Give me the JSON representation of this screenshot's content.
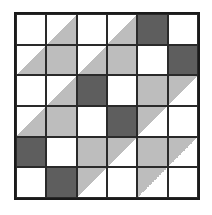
{
  "figure": {
    "rows": 6,
    "cols": 6,
    "colors": {
      "white": "#ffffff",
      "gray": "#bdbdbd",
      "dark": "#5e5e5e",
      "line": "#1a1a1a"
    },
    "legend_codes": {
      "w": "white square",
      "g": "light gray square",
      "d": "dark gray square",
      "lr": "diagonal split, lower-right triangle gray",
      "ul": "diagonal split, upper-left triangle gray"
    },
    "cells": [
      [
        "w",
        "lr",
        "w",
        "lr",
        "d",
        "w"
      ],
      [
        "lr",
        "g",
        "lr",
        "g",
        "w",
        "d"
      ],
      [
        "w",
        "lr",
        "d",
        "w",
        "g",
        "ul"
      ],
      [
        "lr",
        "g",
        "w",
        "d",
        "ul",
        "w"
      ],
      [
        "d",
        "w",
        "g",
        "ul",
        "g",
        "ul"
      ],
      [
        "w",
        "d",
        "ul",
        "w",
        "ul",
        "w"
      ]
    ]
  }
}
